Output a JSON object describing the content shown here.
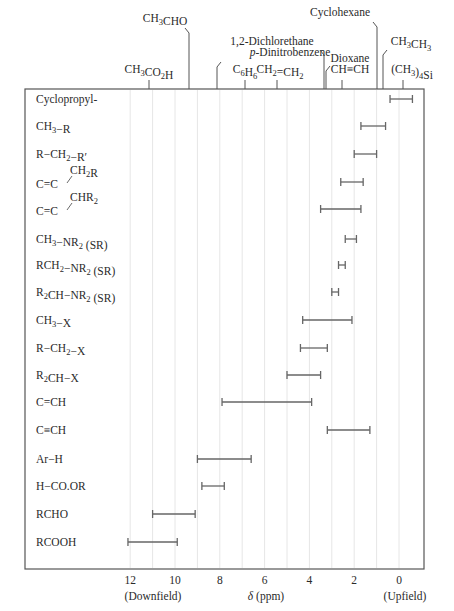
{
  "chart_data": {
    "type": "range-bar",
    "title": "",
    "xlabel": "δ (ppm)",
    "x_direction": "reversed",
    "xlim": [
      12.4,
      -1.0
    ],
    "xticks": [
      12,
      10,
      8,
      6,
      4,
      2,
      0
    ],
    "xtick_labels": [
      "12",
      "10",
      "8",
      "6",
      "4",
      "2",
      "0"
    ],
    "x_end_labels": {
      "left": "(Downfield)",
      "right": "(Upfield)"
    },
    "grid": "vertical, every 1 ppm",
    "categories": [
      "Cyclopropyl-",
      "CH3−R",
      "R−CH2−R′",
      "C=C−CH2R",
      "C=C−CHR2",
      "CH3−NR2 (SR)",
      "RCH2−NR2 (SR)",
      "R2CH−NR2 (SR)",
      "CH3−X",
      "R−CH2−X",
      "R2CH−X",
      "C=CH",
      "C≡CH",
      "Ar−H",
      "H−CO.OR",
      "RCHO",
      "RCOOH"
    ],
    "ranges": [
      {
        "label": "Cyclopropyl-",
        "high": 0.4,
        "low": -0.6
      },
      {
        "label": "CH3−R",
        "high": 1.7,
        "low": 0.6
      },
      {
        "label": "R−CH2−R′",
        "high": 2.0,
        "low": 1.0
      },
      {
        "label": "C=C−CH2R",
        "high": 2.6,
        "low": 1.6
      },
      {
        "label": "C=C−CHR2",
        "high": 3.5,
        "low": 1.7
      },
      {
        "label": "CH3−NR2 (SR)",
        "high": 2.4,
        "low": 1.9
      },
      {
        "label": "RCH2−NR2 (SR)",
        "high": 2.7,
        "low": 2.4
      },
      {
        "label": "R2CH−NR2 (SR)",
        "high": 3.0,
        "low": 2.7
      },
      {
        "label": "CH3−X",
        "high": 4.3,
        "low": 2.1
      },
      {
        "label": "R−CH2−X",
        "high": 4.4,
        "low": 3.2
      },
      {
        "label": "R2CH−X",
        "high": 5.0,
        "low": 3.5
      },
      {
        "label": "C=CH",
        "high": 7.9,
        "low": 3.9
      },
      {
        "label": "C≡CH",
        "high": 3.2,
        "low": 1.3
      },
      {
        "label": "Ar−H",
        "high": 9.0,
        "low": 6.6
      },
      {
        "label": "H−CO.OR",
        "high": 8.8,
        "low": 7.8
      },
      {
        "label": "RCHO",
        "high": 11.0,
        "low": 9.1
      },
      {
        "label": "RCOOH",
        "high": 12.1,
        "low": 9.9
      }
    ],
    "reference_compounds": [
      {
        "label": "CH3CO2H",
        "ppm": 11.0
      },
      {
        "label": "CH3CHO",
        "ppm": 9.3
      },
      {
        "label": "p-Dinitrobenzene",
        "ppm": 8.1
      },
      {
        "label": "C6H6",
        "ppm": 6.9
      },
      {
        "label": "CH2=CH2",
        "ppm": 5.4
      },
      {
        "label": "1,2-Dichlorethane",
        "ppm": 3.4
      },
      {
        "label": "Dioxane",
        "ppm": 3.3
      },
      {
        "label": "CH≡CH",
        "ppm": 2.5
      },
      {
        "label": "Cyclohexane",
        "ppm": 1.0
      },
      {
        "label": "CH3CH3",
        "ppm": 0.7
      },
      {
        "label": "(CH3)4Si",
        "ppm": 0.0
      }
    ]
  },
  "axis": {
    "title_symbol": "δ",
    "title_unit": " (ppm)",
    "downfield": "(Downfield)",
    "upfield": "(Upfield)"
  }
}
